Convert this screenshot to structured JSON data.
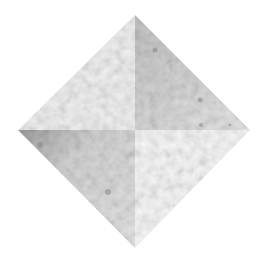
{
  "image": {
    "description": "Diamond shape split into four triangular quadrants with mottled grayscale texture",
    "background": "#ffffff",
    "vertices": {
      "top": [
        135,
        15
      ],
      "right": [
        250,
        130
      ],
      "bottom": [
        135,
        248
      ],
      "left": [
        18,
        130
      ]
    },
    "center": [
      135,
      130
    ],
    "quadrants": [
      {
        "name": "top-left",
        "base_color": "#f1f1f1",
        "texture_color": "#d8d8d8"
      },
      {
        "name": "top-right",
        "base_color": "#d9d9d9",
        "texture_color": "#a8a8a8"
      },
      {
        "name": "bottom-left",
        "base_color": "#dcdcdc",
        "texture_color": "#9a9a9a"
      },
      {
        "name": "bottom-right",
        "base_color": "#f6f6f6",
        "texture_color": "#e2e2e2"
      }
    ]
  }
}
